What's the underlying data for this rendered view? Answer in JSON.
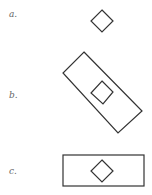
{
  "figure": {
    "panels": [
      {
        "id": "a",
        "label": "a."
      },
      {
        "id": "b",
        "label": "b."
      },
      {
        "id": "c",
        "label": "c."
      }
    ]
  },
  "colors": {
    "stroke": "#333333",
    "label": "#666666",
    "background": "#ffffff"
  }
}
